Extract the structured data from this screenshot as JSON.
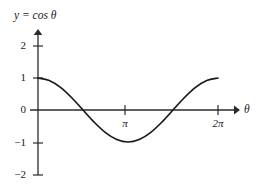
{
  "figure": {
    "title": "y = cos θ",
    "background_color": "#ffffff",
    "ink_color": "#1a1a1a"
  },
  "axes": {
    "x_axis_label": "θ",
    "y_axis_label": "y",
    "x_ticks": [
      {
        "label": "π",
        "value": 3.14159
      },
      {
        "label": "2π",
        "value": 6.28318
      }
    ],
    "y_ticks": [
      {
        "label": "2",
        "value": 2
      },
      {
        "label": "1",
        "value": 1
      },
      {
        "label": "0",
        "value": 0
      },
      {
        "label": "−1",
        "value": -1
      },
      {
        "label": "−2",
        "value": -2
      }
    ]
  },
  "chart_data": {
    "type": "line",
    "title": "y = cos θ",
    "xlabel": "θ",
    "ylabel": "y",
    "xlim": [
      0,
      6.28318
    ],
    "ylim": [
      -2,
      2
    ],
    "grid": false,
    "legend": "none",
    "xtick_labels": [
      "π",
      "2π"
    ],
    "xtick_values": [
      3.14159,
      6.28318
    ],
    "ytick_labels": [
      "2",
      "1",
      "0",
      "−1",
      "−2"
    ],
    "ytick_values": [
      2,
      1,
      0,
      -1,
      -2
    ],
    "series": [
      {
        "name": "y = cos θ",
        "color": "#1a1a1a",
        "x": [
          0,
          0.3927,
          0.7854,
          1.1781,
          1.5708,
          1.9635,
          2.3562,
          2.7489,
          3.14159,
          3.5343,
          3.927,
          4.3197,
          4.7124,
          5.1051,
          5.4978,
          5.8905,
          6.28318
        ],
        "values": [
          1,
          0.9239,
          0.7071,
          0.3827,
          0,
          -0.3827,
          -0.7071,
          -0.9239,
          -1,
          -0.9239,
          -0.7071,
          -0.3827,
          0,
          0.3827,
          0.7071,
          0.9239,
          1
        ]
      }
    ],
    "annotations": [
      {
        "text": "maximum at θ = 0, y = 1"
      },
      {
        "text": "zero at θ = π/2"
      },
      {
        "text": "minimum at θ = π, y = −1"
      },
      {
        "text": "zero at θ = 3π/2"
      },
      {
        "text": "maximum at θ = 2π, y = 1"
      }
    ]
  }
}
